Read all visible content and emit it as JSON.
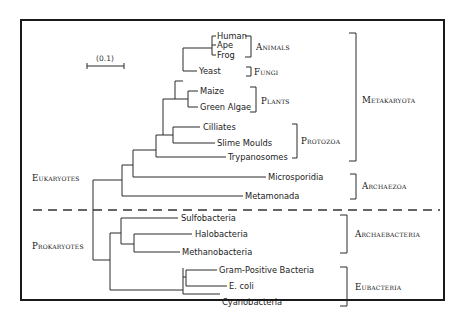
{
  "scale_bar": {
    "label": "(0.1)"
  },
  "domains": {
    "eukaryotes": "Eukaryotes",
    "prokaryotes": "Prokaryotes"
  },
  "leaves": [
    {
      "name": "Human"
    },
    {
      "name": "Ape"
    },
    {
      "name": "Frog"
    },
    {
      "name": "Yeast"
    },
    {
      "name": "Maize"
    },
    {
      "name": "Green Algae"
    },
    {
      "name": "Cilliates"
    },
    {
      "name": "Slime Moulds"
    },
    {
      "name": "Trypanosomes"
    },
    {
      "name": "Microsporidia"
    },
    {
      "name": "Metamonada"
    },
    {
      "name": "Sulfobacteria"
    },
    {
      "name": "Halobacteria"
    },
    {
      "name": "Methanobacteria"
    },
    {
      "name": "Gram-Positive Bacteria"
    },
    {
      "name": "E. coli"
    },
    {
      "name": "Cyanobacteria"
    }
  ],
  "groups": {
    "animals": "Animals",
    "fungi": "Fungi",
    "plants": "Plants",
    "protozoa": "Protozoa",
    "metakaryota": "Metakaryota",
    "archaezoa": "Archaezoa",
    "archaebacteria": "Archaebacteria",
    "eubacteria": "Eubacteria"
  }
}
